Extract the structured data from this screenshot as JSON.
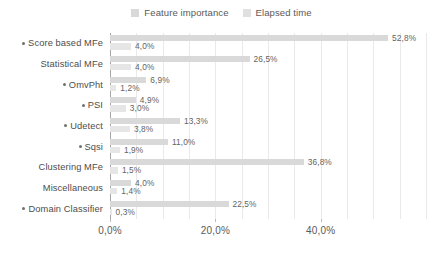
{
  "chart_data": {
    "type": "bar",
    "orientation": "horizontal",
    "title": "",
    "xlabel": "",
    "ylabel": "",
    "xlim": [
      0,
      60
    ],
    "xticks": [
      "0,0%",
      "20,0%",
      "40,0%"
    ],
    "xtick_values": [
      0,
      20,
      40
    ],
    "grid": true,
    "legend_position": "top-center",
    "categories": [
      "Score based MFe",
      "Statistical MFe",
      "OmvPht",
      "PSI",
      "Udetect",
      "Sqsi",
      "Clustering MFe",
      "Miscellaneous",
      "Domain Classifier"
    ],
    "category_markers": [
      true,
      false,
      true,
      true,
      true,
      true,
      false,
      false,
      true
    ],
    "series": [
      {
        "name": "Feature importance",
        "color": "#d9d9d9",
        "values": [
          52.8,
          26.5,
          6.9,
          4.9,
          13.3,
          11.0,
          36.8,
          4.0,
          22.5
        ],
        "labels": [
          "52,8%",
          "26,5%",
          "6,9%",
          "4,9%",
          "13,3%",
          "11,0%",
          "36,8%",
          "4,0%",
          "22,5%"
        ]
      },
      {
        "name": "Elapsed time",
        "color": "#e6e6e6",
        "values": [
          4.0,
          4.0,
          1.2,
          3.0,
          3.8,
          1.9,
          1.5,
          1.4,
          0.3
        ],
        "labels": [
          "4,0%",
          "4,0%",
          "1,2%",
          "3,0%",
          "3,8%",
          "1,9%",
          "1,5%",
          "1,4%",
          "0,3%"
        ]
      }
    ]
  },
  "legend": {
    "items": [
      {
        "label": "Feature importance",
        "color": "#d9d9d9"
      },
      {
        "label": "Elapsed time",
        "color": "#e0e0e0"
      }
    ]
  }
}
